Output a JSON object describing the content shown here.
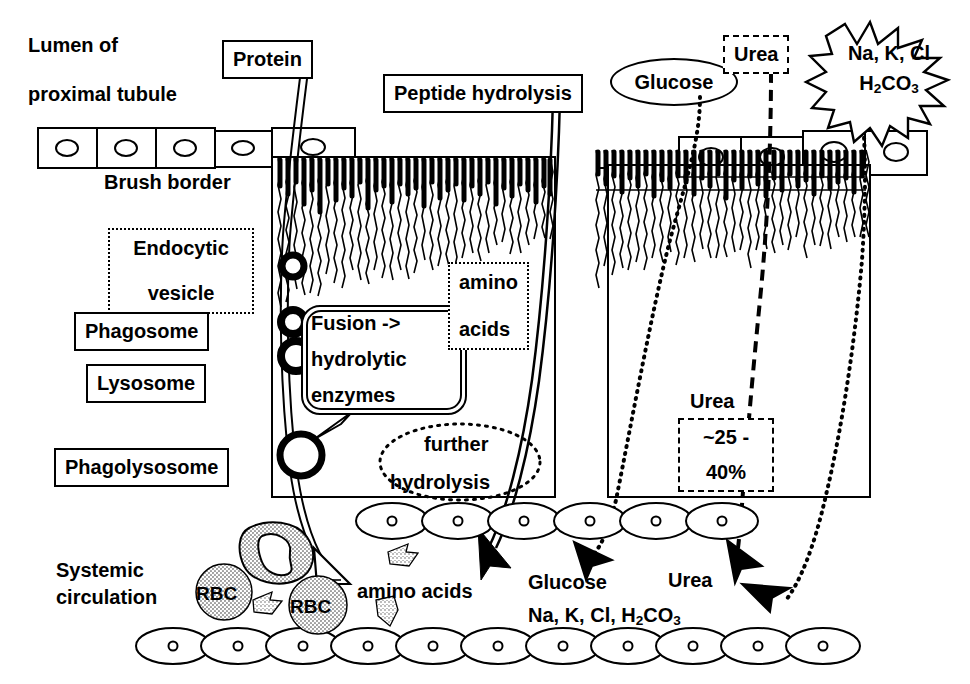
{
  "diagram": {
    "colors": {
      "ink": "#000000",
      "paper": "#ffffff",
      "rbc_fill": "#b8b8b8",
      "arrow_fill": "#000000",
      "hollow_arrow_fill": "#ffffff"
    }
  },
  "labels": {
    "lumen_line1": "Lumen of",
    "lumen_line2": "proximal tubule",
    "protein": "Protein",
    "peptide_hydrolysis": "Peptide hydrolysis",
    "glucose_top": "Glucose",
    "urea_top": "Urea",
    "salts_line1": "Na, K, Cl",
    "salts_line2_pre": "H",
    "salts_line2_sub1": "2",
    "salts_line2_mid": "CO",
    "salts_line2_sub2": "3",
    "brush_border": "Brush border",
    "endocytic_line1": "Endocytic",
    "endocytic_line2": "vesicle",
    "phagosome": "Phagosome",
    "lysosome": "Lysosome",
    "phagolysosome": "Phagolysosome",
    "fusion_line1": "Fusion ->",
    "fusion_line2": "hydrolytic",
    "fusion_line3": "enzymes",
    "amino_line1": "amino",
    "amino_line2": "acids",
    "further_line1": "further",
    "further_line2": "hydrolysis",
    "urea_mid": "Urea",
    "urea_pct_line1": "~25 -",
    "urea_pct_line2": "40%",
    "systemic_line1": "Systemic",
    "systemic_line2": "circulation",
    "rbc_left": "RBC",
    "rbc_right": "RBC",
    "amino_acids_out": "amino acids",
    "glucose_out": "Glucose",
    "urea_out": "Urea",
    "salts_out_pre": "Na, K, Cl, H",
    "salts_out_sub1": "2",
    "salts_out_mid": "CO",
    "salts_out_sub2": "3"
  },
  "icons": {
    "endocytic_vesicle": "vesicle-circle-icon",
    "phagolysosome": "large-vesicle-icon",
    "rbc": "red-blood-cell-icon",
    "wbc": "white-blood-cell-icon",
    "platelet": "platelet-icon",
    "solid_arrow": "solid-arrowhead-icon",
    "hollow_arrow": "hollow-arrowhead-icon",
    "starburst": "starburst-icon",
    "microvilli": "brush-border-microvilli-icon"
  },
  "structures": {
    "epithelial_cell_nucleus": "nucleus-oval",
    "capillary_cell": "endothelial-cell-oval",
    "top_cells_left_count": 5,
    "top_cells_right_count": 4,
    "mid_capillary_count": 11,
    "bottom_capillary_count": 11
  }
}
